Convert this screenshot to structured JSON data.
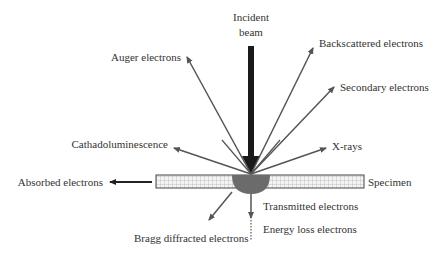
{
  "diagram": {
    "incident_beam": {
      "line1": "Incident",
      "line2": "beam"
    },
    "labels": {
      "auger": "Auger electrons",
      "backscattered": "Backscattered electrons",
      "secondary": "Secondary electrons",
      "cathodoluminescence": "Cathadoluminescence",
      "xrays": "X-rays",
      "absorbed": "Absorbed electrons",
      "specimen": "Specimen",
      "transmitted": "Transmitted electrons",
      "energy_loss": "Energy loss electrons",
      "bragg": "Bragg diffracted electrons"
    },
    "colors": {
      "beam": "#1a1a1a",
      "arrow": "#555555",
      "interaction_volume": "#6b6b6b",
      "specimen_fill": "#f2f2f2",
      "specimen_grid": "#9a9a9a",
      "text": "#333333"
    }
  }
}
